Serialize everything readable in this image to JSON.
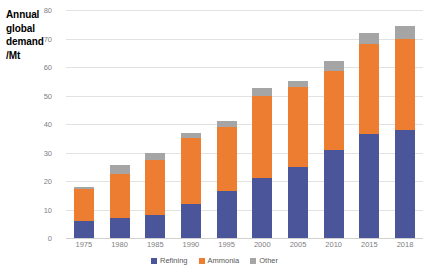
{
  "chart_data": {
    "type": "bar",
    "subtype": "stacked-column",
    "title": "Annual global demand /Mt",
    "xlabel": "",
    "ylabel": "Annual global demand /Mt",
    "ylim": [
      0,
      80
    ],
    "yticks": [
      0,
      10,
      20,
      30,
      40,
      50,
      60,
      70,
      80
    ],
    "grid": true,
    "legend_position": "bottom",
    "categories": [
      "1975",
      "1980",
      "1985",
      "1990",
      "1995",
      "2000",
      "2005",
      "2010",
      "2015",
      "2018"
    ],
    "series": [
      {
        "name": "Refining",
        "color": "#4a5699",
        "values": [
          6,
          7,
          8,
          12,
          16.5,
          21,
          25,
          31,
          36.5,
          38
        ]
      },
      {
        "name": "Ammonia",
        "color": "#ed7d31",
        "values": [
          11.3,
          15.5,
          19.5,
          23,
          22.5,
          29,
          28,
          27.5,
          31.5,
          32
        ]
      },
      {
        "name": "Other",
        "color": "#a5a5a5",
        "values": [
          0.7,
          3,
          2.5,
          2,
          2,
          2.5,
          2,
          3.5,
          4,
          4.5
        ]
      }
    ],
    "totals": [
      18,
      25.5,
      30,
      37,
      41,
      52.5,
      55,
      62,
      72,
      74.5
    ]
  },
  "axis_title": {
    "line1": "Annual",
    "line2": "global",
    "line3": "demand",
    "line4": "/Mt"
  },
  "colors": {
    "refining": "#4a5699",
    "ammonia": "#ed7d31",
    "other": "#a5a5a5",
    "gridline": "#e2e2e2",
    "tick_text": "#808080",
    "legend_text": "#595959",
    "background": "#ffffff"
  }
}
